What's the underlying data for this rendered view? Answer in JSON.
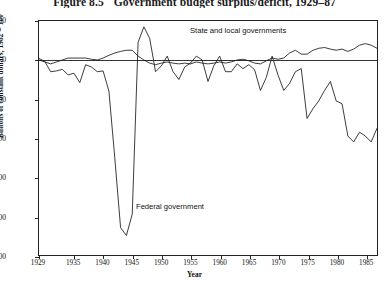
{
  "title": {
    "number": "Figure 8.5",
    "text": "Government budget surplus/deficit, 1929–87"
  },
  "chart_data": {
    "type": "line",
    "title": "Government budget surplus/deficit, 1929–87",
    "xlabel": "Year",
    "ylabel": "Billions of constant dollars, 1982 = 100",
    "xlim": [
      1929,
      1987
    ],
    "ylim": [
      -500,
      100
    ],
    "yticks": [
      100,
      0,
      -100,
      -200,
      -300,
      -400,
      -500
    ],
    "ytick_labels": [
      "100",
      "0",
      "-100",
      "-200",
      "-300",
      "-400",
      "-500"
    ],
    "xticks": [
      1929,
      1935,
      1940,
      1945,
      1950,
      1955,
      1960,
      1965,
      1970,
      1975,
      1980,
      1985
    ],
    "xtick_labels": [
      "1929",
      "1935",
      "1940",
      "1945",
      "1950",
      "1955",
      "1960",
      "1965",
      "1970",
      "1975",
      "1980",
      "1985"
    ],
    "grid": false,
    "legend_position": "inline-annotations",
    "annotations": [
      {
        "name": "state-and-local",
        "text": "State and local governments",
        "x": 1956,
        "y": 72
      },
      {
        "name": "federal",
        "text": "Federal government",
        "x": 1946,
        "y": -350
      }
    ],
    "x": [
      1929,
      1930,
      1931,
      1932,
      1933,
      1934,
      1935,
      1936,
      1937,
      1938,
      1939,
      1940,
      1941,
      1942,
      1943,
      1944,
      1945,
      1946,
      1947,
      1948,
      1949,
      1950,
      1951,
      1952,
      1953,
      1954,
      1955,
      1956,
      1957,
      1958,
      1959,
      1960,
      1961,
      1962,
      1963,
      1964,
      1965,
      1966,
      1967,
      1968,
      1969,
      1970,
      1971,
      1972,
      1973,
      1974,
      1975,
      1976,
      1977,
      1978,
      1979,
      1980,
      1981,
      1982,
      1983,
      1984,
      1985,
      1986,
      1987
    ],
    "series": [
      {
        "name": "Federal government",
        "values": [
          4,
          -4,
          -30,
          -28,
          -24,
          -38,
          -34,
          -58,
          -12,
          -18,
          -30,
          -28,
          -80,
          -250,
          -430,
          -450,
          -395,
          45,
          85,
          55,
          -30,
          -15,
          10,
          -30,
          -50,
          -18,
          -8,
          10,
          0,
          -55,
          -15,
          10,
          -30,
          -30,
          -10,
          -22,
          -12,
          -25,
          -78,
          -45,
          10,
          -38,
          -78,
          -60,
          -30,
          -22,
          -150,
          -125,
          -105,
          -78,
          -55,
          -105,
          -112,
          -195,
          -210,
          -185,
          -195,
          -210,
          -175
        ],
        "color": "#1a1a1a"
      },
      {
        "name": "State and local governments",
        "values": [
          0,
          -5,
          -10,
          -5,
          0,
          5,
          5,
          5,
          5,
          2,
          0,
          5,
          12,
          18,
          22,
          25,
          25,
          10,
          0,
          -8,
          -12,
          -8,
          -5,
          -8,
          -10,
          -8,
          -10,
          -5,
          -8,
          -10,
          -8,
          -5,
          -8,
          -5,
          0,
          2,
          -2,
          -8,
          -10,
          -2,
          5,
          2,
          5,
          18,
          25,
          15,
          15,
          25,
          30,
          32,
          28,
          25,
          28,
          22,
          28,
          38,
          42,
          38,
          30
        ],
        "color": "#1a1a1a"
      }
    ]
  }
}
